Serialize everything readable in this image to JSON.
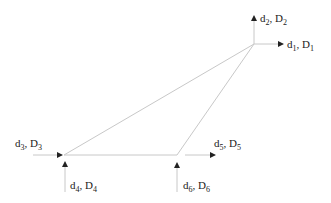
{
  "diagram": {
    "type": "truss-element-dof",
    "colors": {
      "member": "#c8c8c8",
      "arrow": "#222222",
      "text": "#222222"
    },
    "nodes": [
      {
        "id": "top",
        "x": 254,
        "y": 44
      },
      {
        "id": "left",
        "x": 64,
        "y": 155
      },
      {
        "id": "mid",
        "x": 177,
        "y": 155
      }
    ],
    "members": [
      {
        "from": "top",
        "to": "left"
      },
      {
        "from": "top",
        "to": "mid"
      },
      {
        "from": "left",
        "to": "mid"
      }
    ],
    "dofs": [
      {
        "id": "1",
        "d": "d",
        "sub": "1",
        "D": "D",
        "subD": "1",
        "direction": "right",
        "x1": 254,
        "y1": 44,
        "x2": 283,
        "y2": 44,
        "label_x": 287,
        "label_y": 48
      },
      {
        "id": "2",
        "d": "d",
        "sub": "2",
        "D": "D",
        "subD": "2",
        "direction": "up",
        "x1": 254,
        "y1": 44,
        "x2": 254,
        "y2": 16,
        "label_x": 260,
        "label_y": 22
      },
      {
        "id": "3",
        "d": "d",
        "sub": "3",
        "D": "D",
        "subD": "3",
        "direction": "right",
        "x1": 33,
        "y1": 155,
        "x2": 62,
        "y2": 155,
        "label_x": 15,
        "label_y": 147
      },
      {
        "id": "4",
        "d": "d",
        "sub": "4",
        "D": "D",
        "subD": "4",
        "direction": "up",
        "x1": 65,
        "y1": 192,
        "x2": 65,
        "y2": 162,
        "label_x": 70,
        "label_y": 189
      },
      {
        "id": "5",
        "d": "d",
        "sub": "5",
        "D": "D",
        "subD": "5",
        "direction": "right",
        "x1": 185,
        "y1": 155,
        "x2": 215,
        "y2": 155,
        "label_x": 214,
        "label_y": 147
      },
      {
        "id": "6",
        "d": "d",
        "sub": "6",
        "D": "D",
        "subD": "6",
        "direction": "up",
        "x1": 177,
        "y1": 192,
        "x2": 177,
        "y2": 163,
        "label_x": 183,
        "label_y": 189
      }
    ]
  }
}
